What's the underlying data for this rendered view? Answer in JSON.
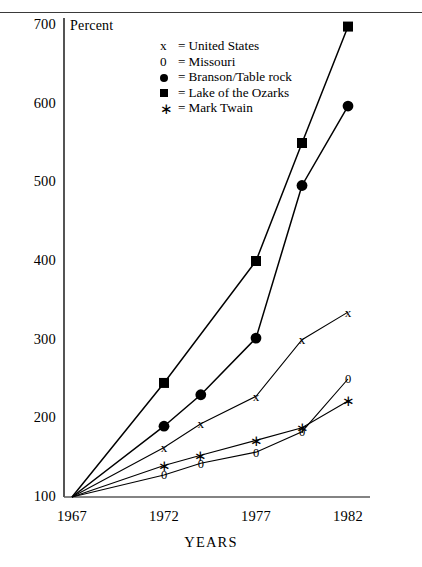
{
  "chart_data": {
    "type": "line",
    "title": "",
    "xlabel": "YEARS",
    "ylabel": "Percent",
    "ylim": [
      100,
      700
    ],
    "xlim": [
      1967,
      1982
    ],
    "yticks": [
      "700",
      "600",
      "500",
      "400",
      "300",
      "200",
      "100"
    ],
    "ytick_values": [
      700,
      600,
      500,
      400,
      300,
      200,
      100
    ],
    "xticks": [
      "1967",
      "1972",
      "1977",
      "1982"
    ],
    "xtick_values": [
      1967,
      1972,
      1977,
      1982
    ],
    "grid": false,
    "legend_position": "upper-center",
    "series": [
      {
        "name": "United States",
        "marker": "x",
        "marker_label": "x",
        "x": [
          1967,
          1972,
          1974,
          1977,
          1979.5,
          1982
        ],
        "values": [
          100,
          163,
          193,
          228,
          300,
          335
        ]
      },
      {
        "name": "Missouri",
        "marker": "0",
        "marker_label": "0",
        "x": [
          1967,
          1972,
          1974,
          1977,
          1979.5,
          1982
        ],
        "values": [
          100,
          128,
          143,
          157,
          183,
          250
        ]
      },
      {
        "name": "Branson/Table rock",
        "marker": "filled-circle",
        "marker_label": "●",
        "x": [
          1967,
          1972,
          1974,
          1977,
          1979.5,
          1982
        ],
        "values": [
          100,
          190,
          230,
          302,
          496,
          597
        ]
      },
      {
        "name": "Lake of the Ozarks",
        "marker": "filled-square",
        "marker_label": "■",
        "x": [
          1967,
          1972,
          1977,
          1979.5,
          1982
        ],
        "values": [
          100,
          245,
          400,
          550,
          698
        ]
      },
      {
        "name": "Mark Twain",
        "marker": "asterisk",
        "marker_label": "∗",
        "x": [
          1967,
          1972,
          1974,
          1977,
          1979.5,
          1982
        ],
        "values": [
          100,
          140,
          153,
          172,
          188,
          222
        ]
      }
    ]
  },
  "legend": {
    "entries": [
      {
        "key": "x",
        "key_type": "text",
        "eq": "=",
        "label": "United States"
      },
      {
        "key": "0",
        "key_type": "text",
        "eq": "=",
        "label": "Missouri"
      },
      {
        "key": "",
        "key_type": "circle",
        "eq": "=",
        "label": "Branson/Table rock"
      },
      {
        "key": "",
        "key_type": "square",
        "eq": "=",
        "label": "Lake of the Ozarks"
      },
      {
        "key": "",
        "key_type": "asterisk",
        "eq": "=",
        "label": "Mark Twain"
      }
    ]
  },
  "axes": {
    "y_unit_label": "Percent",
    "x_title": "YEARS"
  },
  "colors": {
    "ink": "#000000",
    "rule": "#3a3a3a",
    "background": "#ffffff"
  }
}
